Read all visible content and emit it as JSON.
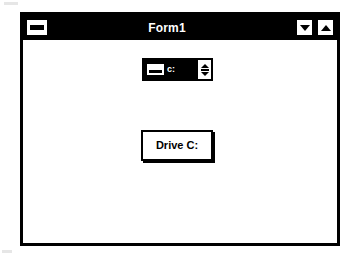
{
  "window": {
    "title": "Form1",
    "sysmenu": {
      "name": "control-menu-box",
      "icon": "minus-bar-icon"
    },
    "title_buttons": [
      {
        "name": "minimize-button",
        "icon": "triangle-down-icon",
        "label": "Minimize"
      },
      {
        "name": "maximize-button",
        "icon": "triangle-up-icon",
        "label": "Maximize"
      }
    ]
  },
  "client": {
    "drive_combo": {
      "label": "Drive list box",
      "value": "c:",
      "icon": "hard-drive-icon",
      "dropdown_icon": "up-down-double-arrow-icon",
      "options": [
        "c:"
      ]
    },
    "command_button": {
      "caption": "Drive C:"
    }
  },
  "colors": {
    "titlebar_background": "#000000",
    "titlebar_text": "#ffffff",
    "window_border": "#000000",
    "client_background": "#ffffff",
    "combo_field_background": "#000000",
    "combo_field_text": "#ffffff",
    "button_face": "#ffffff",
    "button_text": "#000000"
  }
}
